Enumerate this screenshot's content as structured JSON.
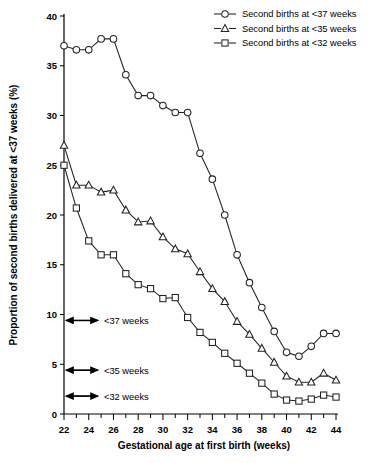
{
  "figure": {
    "background": "#ffffff",
    "line_color": "#222222",
    "marker_fill": "#ffffff"
  },
  "chart_data": {
    "type": "line",
    "title": "",
    "xlabel": "Gestational age at first birth (weeks)",
    "ylabel": "Proportion of second births delivered at <37 weeks (%)",
    "xlim": [
      22,
      44
    ],
    "ylim": [
      0,
      40
    ],
    "xticks": [
      22,
      23,
      24,
      25,
      26,
      27,
      28,
      29,
      30,
      31,
      32,
      33,
      34,
      35,
      36,
      37,
      38,
      39,
      40,
      41,
      42,
      43,
      44
    ],
    "xtick_labels": [
      "22",
      "",
      "24",
      "",
      "26",
      "",
      "28",
      "",
      "30",
      "",
      "32",
      "",
      "34",
      "",
      "36",
      "",
      "38",
      "",
      "40",
      "",
      "42",
      "",
      "44"
    ],
    "yticks": [
      0,
      5,
      10,
      15,
      20,
      25,
      30,
      35,
      40
    ],
    "ytick_labels": [
      "0",
      "5",
      "10",
      "15",
      "20",
      "25",
      "30",
      "35",
      "40"
    ],
    "grid": false,
    "legend_position": "top-right",
    "x": [
      22,
      23,
      24,
      25,
      26,
      27,
      28,
      29,
      30,
      31,
      32,
      33,
      34,
      35,
      36,
      37,
      38,
      39,
      40,
      41,
      42,
      43,
      44
    ],
    "series": [
      {
        "name": "Second births at <37 weeks",
        "marker": "circle",
        "values": [
          37.0,
          36.6,
          36.6,
          37.7,
          37.7,
          34.1,
          32.0,
          32.0,
          31.0,
          30.3,
          30.3,
          26.2,
          23.6,
          20.0,
          16.0,
          13.2,
          10.7,
          8.3,
          6.2,
          5.8,
          6.8,
          8.1,
          8.1
        ]
      },
      {
        "name": "Second births at <35 weeks",
        "marker": "triangle",
        "values": [
          27.0,
          23.0,
          23.0,
          22.3,
          22.5,
          20.5,
          19.3,
          19.4,
          17.8,
          16.6,
          16.1,
          14.3,
          12.6,
          11.3,
          9.3,
          8.0,
          6.6,
          5.2,
          3.8,
          3.2,
          3.2,
          4.1,
          3.4
        ]
      },
      {
        "name": "Second births at <32 weeks",
        "marker": "square",
        "values": [
          25.0,
          20.7,
          17.4,
          16.0,
          16.0,
          14.1,
          13.0,
          12.6,
          11.6,
          11.7,
          9.7,
          8.2,
          7.2,
          6.1,
          5.1,
          4.1,
          3.1,
          2.0,
          1.4,
          1.3,
          1.5,
          1.9,
          1.7
        ]
      }
    ],
    "annotations": [
      {
        "label": "<37 weeks",
        "y": 9.4
      },
      {
        "label": "<35 weeks",
        "y": 4.4
      },
      {
        "label": "<32 weeks",
        "y": 1.8
      }
    ]
  }
}
